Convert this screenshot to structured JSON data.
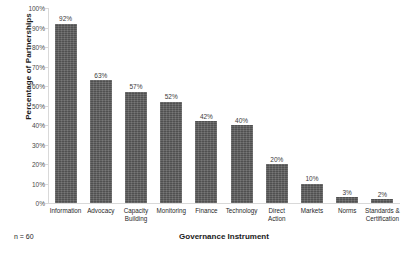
{
  "chart_data": {
    "type": "bar",
    "title": "",
    "xlabel": "Governance Instrument",
    "ylabel": "Percentage of Partnerships",
    "categories": [
      "Information",
      "Advocacy",
      "Capacity Building",
      "Monitoring",
      "Finance",
      "Technology",
      "Direct Action",
      "Markets",
      "Norms",
      "Standards & Certification"
    ],
    "category_lines": [
      [
        "Information"
      ],
      [
        "Advocacy"
      ],
      [
        "Capacity",
        "Building"
      ],
      [
        "Monitoring"
      ],
      [
        "Finance"
      ],
      [
        "Technology"
      ],
      [
        "Direct",
        "Action"
      ],
      [
        "Markets"
      ],
      [
        "Norms"
      ],
      [
        "Standards &",
        "Certification"
      ]
    ],
    "values": [
      92,
      63,
      57,
      52,
      42,
      40,
      20,
      10,
      3,
      2
    ],
    "data_labels": [
      "92%",
      "63%",
      "57%",
      "52%",
      "42%",
      "40%",
      "20%",
      "10%",
      "3%",
      "2%"
    ],
    "ylim": [
      0,
      100
    ],
    "yticks": [
      0,
      10,
      20,
      30,
      40,
      50,
      60,
      70,
      80,
      90,
      100
    ],
    "ytick_labels": [
      "0%",
      "10%",
      "20%",
      "30%",
      "40%",
      "50%",
      "60%",
      "70%",
      "80%",
      "90%",
      "100%"
    ],
    "grid": false,
    "legend": null,
    "bar_color": "#5a5a5a",
    "axis_color": "#d9d9d9",
    "annotation": "n = 60"
  }
}
